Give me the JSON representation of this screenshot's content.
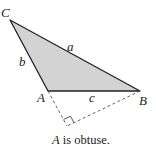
{
  "diagram": {
    "vertices": {
      "A": {
        "label": "A",
        "x": 48,
        "y": 91
      },
      "B": {
        "label": "B",
        "x": 140,
        "y": 91
      },
      "C": {
        "label": "C",
        "x": 10,
        "y": 20
      }
    },
    "sides": {
      "a": {
        "label": "a"
      },
      "b": {
        "label": "b"
      },
      "c": {
        "label": "c"
      }
    },
    "altitude_foot": {
      "x": 67,
      "y": 126
    },
    "fill_color": "#d3d3d3",
    "stroke_color": "#222222",
    "dashed_color": "#555555",
    "caption_prefix": "A",
    "caption_suffix": " is obtuse."
  }
}
